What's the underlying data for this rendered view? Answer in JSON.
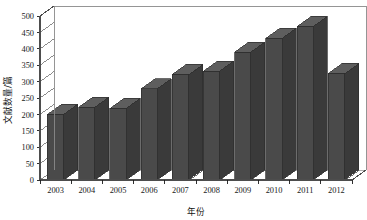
{
  "chart_data": {
    "type": "bar",
    "title": "",
    "subtitle": "",
    "xlabel": "年份",
    "ylabel": "文献数量/篇",
    "categories": [
      "2003",
      "2004",
      "2005",
      "2006",
      "2007",
      "2008",
      "2009",
      "2010",
      "2011",
      "2012"
    ],
    "values": [
      200,
      222,
      218,
      278,
      322,
      332,
      390,
      432,
      468,
      325
    ],
    "series": [
      {
        "name": "文献数量",
        "values": [
          200,
          222,
          218,
          278,
          322,
          332,
          390,
          432,
          468,
          325
        ]
      }
    ],
    "ylim": [
      0,
      500
    ],
    "ytick_step": 50,
    "yticks": [
      "0",
      "50",
      "100",
      "150",
      "200",
      "250",
      "300",
      "350",
      "400",
      "450",
      "500"
    ],
    "grid": true,
    "legend": false,
    "legend_position": "none",
    "style": "3d-column",
    "bar_color": "#4a4a4a",
    "bar_side_color": "#3a3a3a",
    "bar_top_color": "#5e5e5e",
    "grid_color": "#9a9a9a",
    "axis_color": "#6e6e6e",
    "plot_background": "#ffffff"
  }
}
